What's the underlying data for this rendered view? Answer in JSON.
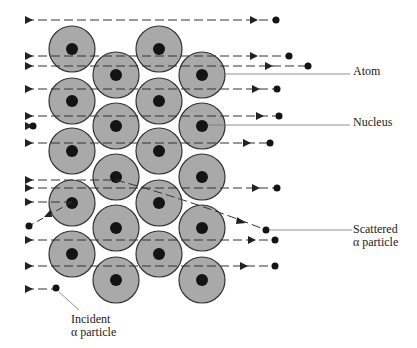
{
  "labels": {
    "atom": "Atom",
    "nucleus": "Nucleus",
    "scattered_line1": "Scattered",
    "scattered_line2": "α particle",
    "incident_line1": "Incident",
    "incident_line2": "α particle"
  },
  "colors": {
    "atom_fill": "#a9a9a9",
    "atom_stroke": "#333333",
    "nucleus": "#141414",
    "path": "#333333",
    "leader": "#777777"
  },
  "atoms": {
    "radius": 23,
    "nucleus_radius": 6,
    "centers": [
      [
        72,
        49
      ],
      [
        72,
        101
      ],
      [
        72,
        151
      ],
      [
        72,
        203
      ],
      [
        72,
        254
      ],
      [
        159,
        49
      ],
      [
        159,
        101
      ],
      [
        159,
        151
      ],
      [
        159,
        203
      ],
      [
        159,
        254
      ],
      [
        116,
        75
      ],
      [
        116,
        126
      ],
      [
        116,
        177
      ],
      [
        116,
        228
      ],
      [
        116,
        280
      ],
      [
        202,
        75
      ],
      [
        202,
        126
      ],
      [
        202,
        177
      ],
      [
        202,
        228
      ],
      [
        202,
        280
      ]
    ]
  },
  "straight_paths": [
    {
      "y": 20,
      "arrow_start": 25,
      "arrow_end": 250,
      "dot": 276
    },
    {
      "y": 56,
      "arrow_start": 25,
      "arrow_end": 250,
      "dot": 289
    },
    {
      "y": 66,
      "arrow_start": 25,
      "arrow_end": 265,
      "dot": 308
    },
    {
      "y": 89,
      "arrow_start": 25,
      "arrow_end": 252,
      "dot": 277
    },
    {
      "y": 116,
      "arrow_start": 25,
      "arrow_end": 256,
      "dot": 279
    },
    {
      "y": 143,
      "arrow_start": 25,
      "arrow_end": 243,
      "dot": 270
    },
    {
      "y": 188,
      "arrow_start": 25,
      "arrow_end": 252,
      "dot": 277
    },
    {
      "y": 240,
      "arrow_start": 25,
      "arrow_end": 248,
      "dot": 275
    },
    {
      "y": 266,
      "arrow_start": 25,
      "arrow_end": 240,
      "dot": 275
    }
  ]
}
